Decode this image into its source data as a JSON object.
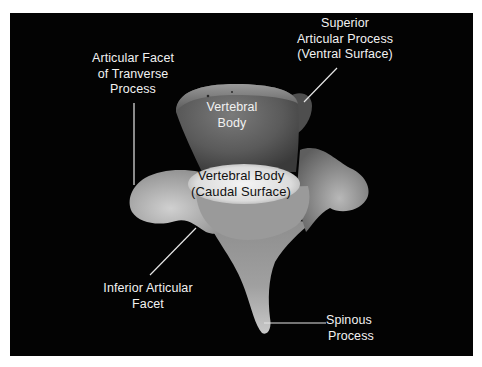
{
  "figure": {
    "background_color": "#030303",
    "label_color": "#f2f2f2",
    "leader_line_color": "#e6e6e6",
    "labels": {
      "transverse_facet": {
        "lines": [
          "Articular Facet",
          "of Tranverse",
          "Process"
        ]
      },
      "superior_process": {
        "lines": [
          "Superior",
          "Articular Process",
          "(Ventral Surface)"
        ]
      },
      "vertebral_body": {
        "lines": [
          "Vertebral",
          "Body"
        ]
      },
      "caudal_surface": {
        "lines": [
          "Vertebral Body",
          "(Caudal Surface)"
        ]
      },
      "inferior_facet": {
        "lines": [
          "Inferior Articular",
          "Facet"
        ]
      },
      "spinous_process": {
        "lines": [
          "Spinous",
          "Process"
        ]
      }
    }
  }
}
